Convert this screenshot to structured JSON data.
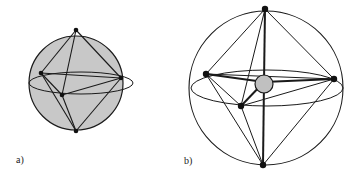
{
  "figures": [
    {
      "label": "a)",
      "description": "Octahedron inscribed in a shaded sphere",
      "sphere_fill": "#c8c8c8"
    },
    {
      "label": "b)",
      "description": "Octahedron inscribed in an unshaded sphere with central atom",
      "sphere_fill": "#ffffff",
      "center_atom_fill": "#c0c0c0"
    }
  ],
  "colors": {
    "stroke": "#1a1a1a",
    "vertex": "#111111"
  }
}
